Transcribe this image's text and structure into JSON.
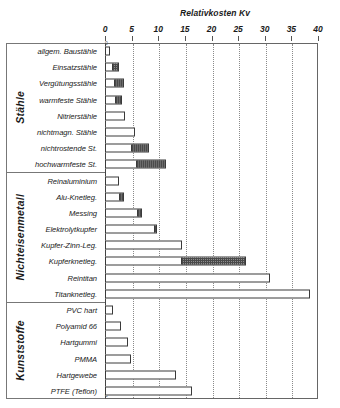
{
  "chart": {
    "title": "Relativkosten Kv",
    "axis": {
      "xlabel": "Relativkosten Kv",
      "ticks": [
        0,
        5,
        10,
        15,
        20,
        25,
        30,
        35,
        40
      ]
    },
    "groups": [
      "Stähle",
      "Nichteisenmetall",
      "Kunststoffe"
    ]
  },
  "chart_data": {
    "type": "bar",
    "orientation": "horizontal",
    "title": "Relativkosten Kv",
    "xlabel": "Relativkosten Kv",
    "ylabel": "",
    "xlim": [
      0,
      40
    ],
    "xticks": [
      0,
      5,
      10,
      15,
      20,
      25,
      30,
      35,
      40
    ],
    "grid": "vertical-dotted",
    "legend": "none",
    "series": [
      {
        "name": "Basiswert",
        "note": "weisser Balkenteil"
      },
      {
        "name": "Oberer Bereich",
        "note": "schraffierter Balkenteil"
      }
    ],
    "groups": [
      {
        "name": "Stähle",
        "categories": [
          "allgem. Baustähle",
          "Einsatzstähle",
          "Vergütungsstähle",
          "warmfeste Stähle",
          "Nitrierstähle",
          "nichtmagn. Stähle",
          "nichtrostende St.",
          "hochwarmfeste St."
        ],
        "base": [
          1.0,
          1.5,
          1.8,
          2.0,
          3.8,
          5.6,
          5.0,
          6.0
        ],
        "top": [
          1.0,
          2.6,
          3.6,
          3.2,
          3.8,
          5.6,
          8.2,
          11.5
        ]
      },
      {
        "name": "Nichteisenmetall",
        "categories": [
          "Reinaluminium",
          "Alu-Knetleg.",
          "Messing",
          "Elektrolytkupfer",
          "Kupfer-Zinn-Leg.",
          "Kupferknetleg.",
          "Reintitan",
          "Titanknetleg."
        ],
        "base": [
          2.6,
          2.8,
          6.2,
          9.3,
          14.5,
          14.5,
          31.0,
          38.5
        ],
        "top": [
          2.6,
          3.6,
          7.0,
          9.8,
          14.5,
          26.5,
          31.0,
          38.5
        ]
      },
      {
        "name": "Kunststoffe",
        "categories": [
          "PVC hart",
          "Polyamid 66",
          "Hartgummi",
          "PMMA",
          "Hartgewebe",
          "PTFE (Teflon)"
        ],
        "base": [
          1.5,
          3.0,
          4.4,
          4.8,
          13.3,
          16.3
        ],
        "top": [
          1.5,
          3.0,
          4.4,
          4.8,
          13.3,
          16.3
        ]
      }
    ]
  }
}
